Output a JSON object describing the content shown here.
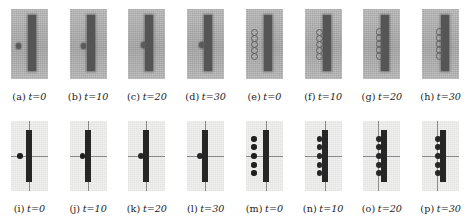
{
  "figure": {
    "kind": "multi-panel-simulation-montage",
    "rows": 2,
    "columns": 8,
    "panel_count": 16,
    "row_descriptions": {
      "top": "grayscale rendered snapshots on gray background",
      "bottom": "schematic snapshots on light background with crosshair axes"
    }
  },
  "panels": [
    {
      "id": "a",
      "tag": "(a)",
      "time_label": "t=0",
      "time_value": 0,
      "row": "top",
      "style": "gray",
      "bar": {
        "x": 17,
        "y": 6,
        "w": 8,
        "h": 56
      },
      "particles": [
        {
          "cx": 8,
          "cy": 37,
          "r": 2.6,
          "variant": "solid"
        }
      ]
    },
    {
      "id": "b",
      "tag": "(b)",
      "time_label": "t=10",
      "time_value": 10,
      "row": "top",
      "style": "gray",
      "bar": {
        "x": 17,
        "y": 6,
        "w": 8,
        "h": 56
      },
      "particles": [
        {
          "cx": 14,
          "cy": 37,
          "r": 2.6,
          "variant": "solid"
        }
      ]
    },
    {
      "id": "c",
      "tag": "(c)",
      "time_label": "t=20",
      "time_value": 20,
      "row": "top",
      "style": "gray",
      "bar": {
        "x": 17,
        "y": 6,
        "w": 8,
        "h": 56
      },
      "particles": [
        {
          "cx": 15,
          "cy": 36,
          "r": 2.8,
          "variant": "solid"
        }
      ]
    },
    {
      "id": "d",
      "tag": "(d)",
      "time_label": "t=30",
      "time_value": 30,
      "row": "top",
      "style": "gray",
      "bar": {
        "x": 17,
        "y": 6,
        "w": 8,
        "h": 56
      },
      "particles": [
        {
          "cx": 15,
          "cy": 36,
          "r": 2.8,
          "variant": "solid"
        }
      ]
    },
    {
      "id": "e",
      "tag": "(e)",
      "time_label": "t=0",
      "time_value": 0,
      "row": "top",
      "style": "gray",
      "bar": {
        "x": 18,
        "y": 6,
        "w": 8,
        "h": 56
      },
      "particles": [
        {
          "cx": 8,
          "cy": 22,
          "r": 2.5,
          "variant": "ring"
        },
        {
          "cx": 8,
          "cy": 28,
          "r": 2.5,
          "variant": "ring"
        },
        {
          "cx": 8,
          "cy": 34,
          "r": 2.5,
          "variant": "ring"
        },
        {
          "cx": 8,
          "cy": 40,
          "r": 2.5,
          "variant": "ring"
        },
        {
          "cx": 8,
          "cy": 46,
          "r": 2.5,
          "variant": "ring"
        }
      ]
    },
    {
      "id": "f",
      "tag": "(f)",
      "time_label": "t=10",
      "time_value": 10,
      "row": "top",
      "style": "gray",
      "bar": {
        "x": 18,
        "y": 6,
        "w": 8,
        "h": 56
      },
      "particles": [
        {
          "cx": 14,
          "cy": 22,
          "r": 2.5,
          "variant": "ring"
        },
        {
          "cx": 14,
          "cy": 28,
          "r": 2.5,
          "variant": "ring"
        },
        {
          "cx": 14,
          "cy": 34,
          "r": 2.5,
          "variant": "ring"
        },
        {
          "cx": 14,
          "cy": 40,
          "r": 2.5,
          "variant": "ring"
        },
        {
          "cx": 14,
          "cy": 46,
          "r": 2.5,
          "variant": "ring"
        }
      ]
    },
    {
      "id": "g",
      "tag": "(g)",
      "time_label": "t=20",
      "time_value": 20,
      "row": "top",
      "style": "gray",
      "bar": {
        "x": 18,
        "y": 6,
        "w": 8,
        "h": 56
      },
      "particles": [
        {
          "cx": 15,
          "cy": 22,
          "r": 2.6,
          "variant": "ring"
        },
        {
          "cx": 15,
          "cy": 28,
          "r": 2.6,
          "variant": "ring"
        },
        {
          "cx": 15,
          "cy": 34,
          "r": 2.6,
          "variant": "ring"
        },
        {
          "cx": 15,
          "cy": 40,
          "r": 2.6,
          "variant": "ring"
        },
        {
          "cx": 15,
          "cy": 46,
          "r": 2.6,
          "variant": "ring"
        }
      ]
    },
    {
      "id": "h",
      "tag": "(h)",
      "time_label": "t=30",
      "time_value": 30,
      "row": "top",
      "style": "gray",
      "bar": {
        "x": 19,
        "y": 6,
        "w": 8,
        "h": 56
      },
      "particles": [
        {
          "cx": 16,
          "cy": 22,
          "r": 2.6,
          "variant": "ring"
        },
        {
          "cx": 16,
          "cy": 28,
          "r": 2.6,
          "variant": "ring"
        },
        {
          "cx": 16,
          "cy": 34,
          "r": 2.6,
          "variant": "ring"
        },
        {
          "cx": 16,
          "cy": 40,
          "r": 2.6,
          "variant": "ring"
        },
        {
          "cx": 16,
          "cy": 46,
          "r": 2.6,
          "variant": "ring"
        }
      ]
    },
    {
      "id": "i",
      "tag": "(i)",
      "time_label": "t=0",
      "time_value": 0,
      "row": "bottom",
      "style": "plain",
      "axes": {
        "vx": 18,
        "hy": 35
      },
      "bar": {
        "x": 15,
        "y": 9,
        "w": 6,
        "h": 52
      },
      "particles": [
        {
          "cx": 9,
          "cy": 35,
          "r": 2.8,
          "variant": "solid"
        }
      ]
    },
    {
      "id": "j",
      "tag": "(j)",
      "time_label": "t=10",
      "time_value": 10,
      "row": "bottom",
      "style": "plain",
      "axes": {
        "vx": 18,
        "hy": 35
      },
      "bar": {
        "x": 15,
        "y": 9,
        "w": 6,
        "h": 52
      },
      "particles": [
        {
          "cx": 13,
          "cy": 35,
          "r": 2.8,
          "variant": "solid"
        }
      ]
    },
    {
      "id": "k",
      "tag": "(k)",
      "time_label": "t=20",
      "time_value": 20,
      "row": "bottom",
      "style": "plain",
      "axes": {
        "vx": 18,
        "hy": 35
      },
      "bar": {
        "x": 15,
        "y": 9,
        "w": 6,
        "h": 52
      },
      "particles": [
        {
          "cx": 13,
          "cy": 35,
          "r": 3.0,
          "variant": "merged"
        }
      ]
    },
    {
      "id": "l",
      "tag": "(l)",
      "time_label": "t=30",
      "time_value": 30,
      "row": "bottom",
      "style": "plain",
      "axes": {
        "vx": 18,
        "hy": 35
      },
      "bar": {
        "x": 15,
        "y": 9,
        "w": 6,
        "h": 52
      },
      "particles": [
        {
          "cx": 13,
          "cy": 35,
          "r": 3.0,
          "variant": "merged"
        }
      ]
    },
    {
      "id": "m",
      "tag": "(m)",
      "time_label": "t=0",
      "time_value": 0,
      "row": "bottom",
      "style": "plain",
      "axes": {
        "vx": 20,
        "hy": 35
      },
      "bar": {
        "x": 17,
        "y": 9,
        "w": 6,
        "h": 52
      },
      "particles": [
        {
          "cx": 8,
          "cy": 18,
          "r": 2.7,
          "variant": "solid"
        },
        {
          "cx": 8,
          "cy": 26,
          "r": 2.7,
          "variant": "solid"
        },
        {
          "cx": 8,
          "cy": 35,
          "r": 2.7,
          "variant": "solid"
        },
        {
          "cx": 8,
          "cy": 44,
          "r": 2.7,
          "variant": "solid"
        },
        {
          "cx": 8,
          "cy": 52,
          "r": 2.7,
          "variant": "solid"
        }
      ]
    },
    {
      "id": "n",
      "tag": "(n)",
      "time_label": "t=10",
      "time_value": 10,
      "row": "bottom",
      "style": "plain",
      "axes": {
        "vx": 20,
        "hy": 35
      },
      "bar": {
        "x": 17,
        "y": 9,
        "w": 6,
        "h": 52
      },
      "particles": [
        {
          "cx": 15,
          "cy": 18,
          "r": 2.7,
          "variant": "merged"
        },
        {
          "cx": 15,
          "cy": 26,
          "r": 2.7,
          "variant": "merged"
        },
        {
          "cx": 15,
          "cy": 35,
          "r": 2.7,
          "variant": "merged"
        },
        {
          "cx": 15,
          "cy": 44,
          "r": 2.7,
          "variant": "merged"
        },
        {
          "cx": 15,
          "cy": 52,
          "r": 2.7,
          "variant": "merged"
        }
      ]
    },
    {
      "id": "o",
      "tag": "(o)",
      "time_label": "t=20",
      "time_value": 20,
      "row": "bottom",
      "style": "plain",
      "axes": {
        "vx": 15,
        "hy": 35
      },
      "bar": {
        "x": 18,
        "y": 9,
        "w": 6,
        "h": 52
      },
      "particles": [
        {
          "cx": 16,
          "cy": 18,
          "r": 2.9,
          "variant": "merged"
        },
        {
          "cx": 16,
          "cy": 26,
          "r": 2.9,
          "variant": "merged"
        },
        {
          "cx": 16,
          "cy": 35,
          "r": 2.9,
          "variant": "merged"
        },
        {
          "cx": 16,
          "cy": 44,
          "r": 2.9,
          "variant": "merged"
        },
        {
          "cx": 16,
          "cy": 52,
          "r": 2.9,
          "variant": "merged"
        }
      ]
    },
    {
      "id": "p",
      "tag": "(p)",
      "time_label": "t=30",
      "time_value": 30,
      "row": "bottom",
      "style": "plain",
      "axes": {
        "vx": 15,
        "hy": 35
      },
      "bar": {
        "x": 18,
        "y": 9,
        "w": 6,
        "h": 52
      },
      "particles": [
        {
          "cx": 16,
          "cy": 18,
          "r": 2.9,
          "variant": "merged"
        },
        {
          "cx": 16,
          "cy": 26,
          "r": 2.9,
          "variant": "merged"
        },
        {
          "cx": 16,
          "cy": 35,
          "r": 2.9,
          "variant": "merged"
        },
        {
          "cx": 16,
          "cy": 44,
          "r": 2.9,
          "variant": "merged"
        },
        {
          "cx": 16,
          "cy": 52,
          "r": 2.9,
          "variant": "merged"
        }
      ]
    }
  ],
  "colors": {
    "gray_background": "#b4b4b4",
    "plain_background": "#f0f0ee",
    "bar_gray": "#555555",
    "bar_plain": "#262626",
    "particle_gray": "#5b5b5b",
    "particle_plain": "#1f1f1f",
    "axis": "#8a8a8a",
    "caption_text": "#1a1a1a",
    "page_background": "#ffffff"
  }
}
